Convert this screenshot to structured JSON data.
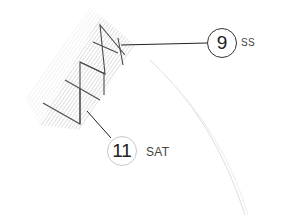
{
  "callouts": [
    {
      "number": "9",
      "label": "SS",
      "style": "dark"
    },
    {
      "number": "11",
      "label": "SAT",
      "style": "light"
    }
  ],
  "colors": {
    "stitch": "#4a4a4a",
    "hatch": "#b5b5b5",
    "leader": "#222222",
    "arc": "#dcdcdc"
  }
}
